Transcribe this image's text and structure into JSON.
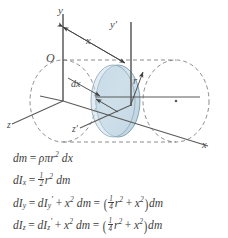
{
  "figure": {
    "diagram": {
      "axes": [
        {
          "name": "y-axis",
          "label": "y"
        },
        {
          "name": "x-axis",
          "label": "x"
        },
        {
          "name": "z-axis",
          "label": "z"
        },
        {
          "name": "y-prime-axis",
          "label": "y′"
        },
        {
          "name": "z-prime-axis",
          "label": "z′"
        }
      ],
      "origin_label": "O",
      "distance_label": "x",
      "thickness_label": "dx",
      "radius_label": "r",
      "colors": {
        "disk_fill": "#c6dae5",
        "disk_edge": "#6d8e9f",
        "line": "#4a4a4a",
        "dashed": "#6a6a6a",
        "text": "#3d3d3d"
      }
    },
    "equations": [
      {
        "id": "dm",
        "text": "dm = ρπr² dx",
        "lhs": "dm",
        "rhs": "ρπr² dx"
      },
      {
        "id": "dIx",
        "text": "dIₓ = ½r² dm",
        "lhs": "dIₓ",
        "rhs": "½ r² dm"
      },
      {
        "id": "dIy",
        "text": "dIᵧ = dIᵧ′ + x² dm = (¼ r² + x²)dm",
        "lhs": "dIᵧ",
        "rhs": "dIᵧ′ + x² dm = (¼ r² + x²)dm"
      },
      {
        "id": "dIz",
        "text": "dIᶻ = dIᶻ′ + x² dm = (¼ r² + x²)dm",
        "lhs": "dIᶻ",
        "rhs": "dIᶻ′ + x² dm = (¼ r² + x²)dm"
      }
    ],
    "symbols": {
      "d": "d",
      "m": "m",
      "I": "I",
      "r": "r",
      "x": "x",
      "y": "y",
      "z": "z",
      "rho": "ρ",
      "pi": "π",
      "equals": "=",
      "plus": "+",
      "prime": "′",
      "two": "2",
      "one": "1",
      "four": "4",
      "lparen": "(",
      "rparen": ")"
    }
  }
}
